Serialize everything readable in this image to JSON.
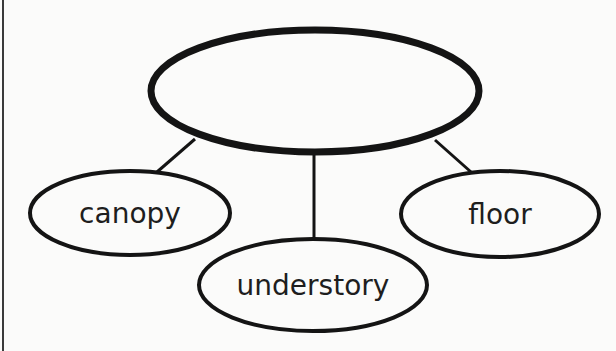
{
  "diagram": {
    "type": "concept-web",
    "stroke_color": "#141414",
    "text_color": "#1e1e1e",
    "background": "#fbfbfa",
    "central_node": {
      "label": "",
      "cx": 315,
      "cy": 91,
      "rx": 164,
      "ry": 61,
      "stroke_width": 7
    },
    "nodes": [
      {
        "label": "canopy",
        "cx": 130,
        "cy": 213,
        "rx": 100,
        "ry": 42,
        "stroke_width": 4
      },
      {
        "label": "understory",
        "cx": 313,
        "cy": 285,
        "rx": 114,
        "ry": 46,
        "stroke_width": 4
      },
      {
        "label": "floor",
        "cx": 500,
        "cy": 214,
        "rx": 99,
        "ry": 43,
        "stroke_width": 4
      }
    ],
    "edges": [
      {
        "from": "central",
        "to": "canopy",
        "x1": 195,
        "y1": 139,
        "x2": 157,
        "y2": 172
      },
      {
        "from": "central",
        "to": "understory",
        "x1": 314,
        "y1": 152,
        "x2": 314,
        "y2": 239
      },
      {
        "from": "central",
        "to": "floor",
        "x1": 435,
        "y1": 140,
        "x2": 471,
        "y2": 172
      }
    ]
  }
}
